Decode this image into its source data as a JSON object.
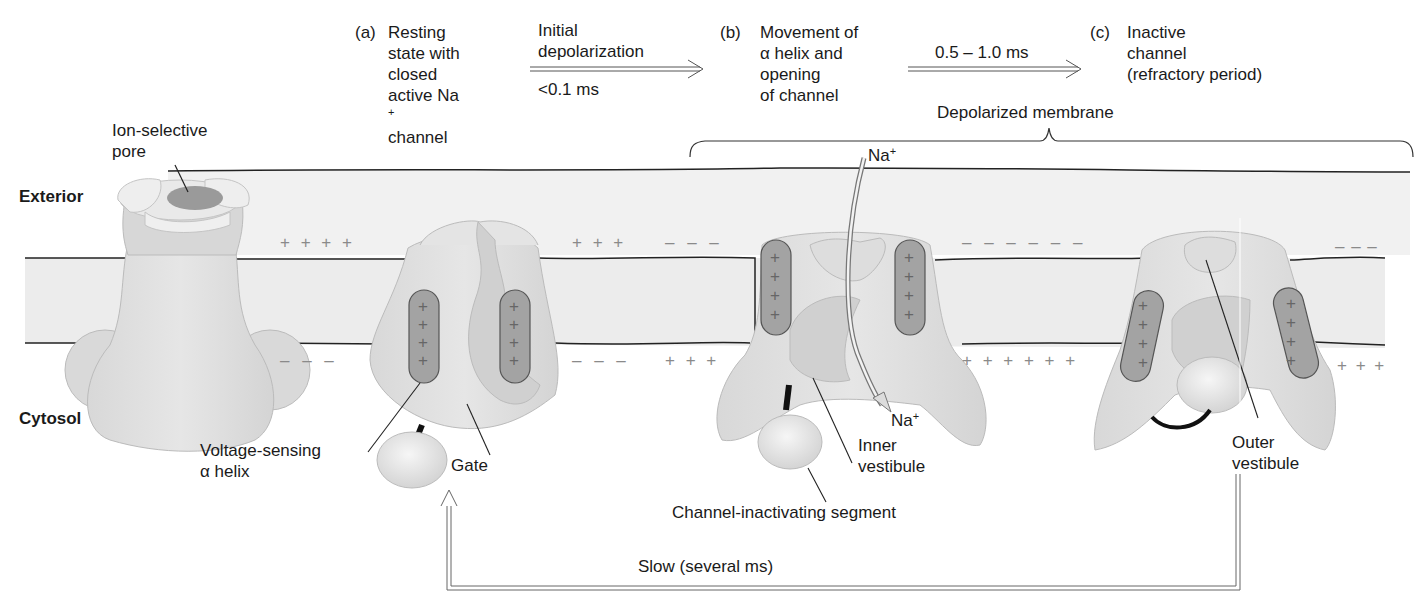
{
  "figure": {
    "stages": [
      {
        "letter": "(a)",
        "lines": [
          "Resting",
          "state with",
          "closed",
          "active Na",
          "channel"
        ],
        "na_sup_line": 3
      },
      {
        "letter": "(b)",
        "lines": [
          "Movement of",
          "α helix and",
          "opening",
          "of channel"
        ]
      },
      {
        "letter": "(c)",
        "lines": [
          "Inactive",
          "channel",
          "(refractory period)"
        ]
      }
    ],
    "transitions": [
      {
        "above": "Initial",
        "above2": "depolarization",
        "below": "<0.1 ms"
      },
      {
        "above": "0.5 – 1.0 ms",
        "below": ""
      }
    ],
    "regions": {
      "exterior": "Exterior",
      "cytosol": "Cytosol",
      "depolarized": "Depolarized membrane"
    },
    "labels": {
      "pore": [
        "Ion-selective",
        "pore"
      ],
      "voltage_sensing": [
        "Voltage-sensing",
        "α helix"
      ],
      "gate": "Gate",
      "na_in": "Na",
      "na_out": "Na",
      "ion_sup": "+",
      "inner_vestibule": [
        "Inner",
        "vestibule"
      ],
      "inactivating_segment": "Channel-inactivating segment",
      "outer_vestibule": [
        "Outer",
        "vestibule"
      ],
      "recovery": "Slow (several ms)"
    },
    "charges": {
      "resting_exterior": "+ + + +",
      "resting_cytosol": "– – –",
      "a_right_ext": "+ + +",
      "a_right_cyt": "– – –",
      "b_left_ext": "– – –",
      "b_left_cyt": "+ + +",
      "b_right_ext": "– – – – – –",
      "b_right_cyt": "+ + + + + +",
      "c_right_ext": "– – –",
      "c_right_cyt": "+ + +",
      "helix_charge": "+"
    },
    "colors": {
      "membrane_fill": "#eeeeee",
      "protein_light": "#e2e2e2",
      "protein_mid": "#d2d2d2",
      "helix_fill": "#a3a3a3",
      "charge_color": "#8a8a8a",
      "line": "#222222"
    }
  }
}
